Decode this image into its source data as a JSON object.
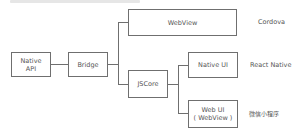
{
  "diagram": {
    "title_fragment": "",
    "nodes": {
      "native_api": {
        "line1": "Native",
        "line2": "API"
      },
      "bridge": {
        "label": "Bridge"
      },
      "webview": {
        "label": "WebView"
      },
      "jscore": {
        "label": "JSCore"
      },
      "native_ui": {
        "label": "Native UI"
      },
      "web_ui": {
        "line1": "Web UI",
        "line2": "( WebView )"
      }
    },
    "categories": {
      "cordova": "Cordova",
      "react_native": "React Native",
      "wechat_mini_program": "微信小程序"
    },
    "edges": [
      [
        "Native API",
        "Bridge"
      ],
      [
        "Bridge",
        "WebView"
      ],
      [
        "Bridge",
        "JSCore"
      ],
      [
        "JSCore",
        "Native UI"
      ],
      [
        "JSCore",
        "Web UI (WebView)"
      ]
    ],
    "colors": {
      "stroke": "#6f6f6f",
      "text": "#555555",
      "background": "#ffffff"
    }
  }
}
